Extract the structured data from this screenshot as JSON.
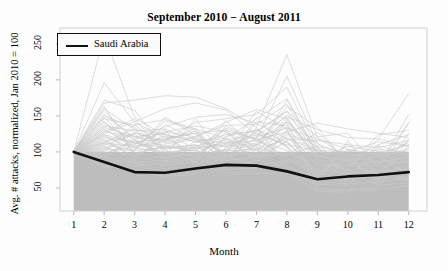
{
  "chart_data": {
    "type": "line",
    "title": "September 2010 − August 2011",
    "xlabel": "Month",
    "ylabel": "Avg. # attacks, normalized, Jan 2010 = 100",
    "xlim": [
      0.55,
      12.6
    ],
    "ylim": [
      18,
      272
    ],
    "xticks": [
      "1",
      "2",
      "3",
      "4",
      "5",
      "6",
      "7",
      "8",
      "9",
      "10",
      "11",
      "12"
    ],
    "yticks": [
      "50",
      "100",
      "150",
      "200",
      "250"
    ],
    "grid": false,
    "legend": {
      "position": "top-left",
      "entries": [
        {
          "label": "Saudi Arabia",
          "color": "#111111",
          "style": "solid-thick"
        }
      ]
    },
    "shaded_band": {
      "label": "reference band below index 100",
      "y_from": 18,
      "y_to": 100,
      "x_from": 1,
      "x_to": 12,
      "color": "#bdbdbd"
    },
    "categories": [
      1,
      2,
      3,
      4,
      5,
      6,
      7,
      8,
      9,
      10,
      11,
      12
    ],
    "series": [
      {
        "name": "Saudi Arabia",
        "highlight": true,
        "color": "#111111",
        "values": [
          100,
          86,
          72,
          71,
          77,
          82,
          81,
          73,
          62,
          66,
          68,
          72
        ]
      },
      {
        "name": "country-01",
        "color": "#c9c9c9",
        "values": [
          100,
          262,
          148,
          122,
          118,
          112,
          121,
          133,
          118,
          104,
          96,
          101
        ]
      },
      {
        "name": "country-02",
        "color": "#c9c9c9",
        "values": [
          100,
          196,
          141,
          119,
          126,
          130,
          118,
          205,
          111,
          95,
          98,
          110
        ]
      },
      {
        "name": "country-03",
        "color": "#c9c9c9",
        "values": [
          100,
          168,
          172,
          178,
          176,
          160,
          134,
          235,
          120,
          92,
          99,
          96
        ]
      },
      {
        "name": "country-04",
        "color": "#c9c9c9",
        "values": [
          100,
          152,
          120,
          116,
          141,
          146,
          152,
          190,
          104,
          90,
          93,
          113
        ]
      },
      {
        "name": "country-05",
        "color": "#c9c9c9",
        "values": [
          100,
          146,
          137,
          145,
          132,
          119,
          146,
          174,
          99,
          88,
          110,
          124
        ]
      },
      {
        "name": "country-06",
        "color": "#c9c9c9",
        "values": [
          100,
          141,
          112,
          106,
          122,
          137,
          138,
          166,
          96,
          86,
          104,
          98
        ]
      },
      {
        "name": "country-07",
        "color": "#c9c9c9",
        "values": [
          100,
          136,
          129,
          132,
          113,
          124,
          129,
          157,
          94,
          102,
          95,
          92
        ]
      },
      {
        "name": "country-08",
        "color": "#c9c9c9",
        "values": [
          100,
          132,
          106,
          98,
          108,
          117,
          123,
          149,
          131,
          120,
          118,
          181
        ]
      },
      {
        "name": "country-09",
        "color": "#c9c9c9",
        "values": [
          100,
          128,
          121,
          126,
          104,
          110,
          115,
          142,
          89,
          84,
          86,
          92
        ]
      },
      {
        "name": "country-10",
        "color": "#c9c9c9",
        "values": [
          100,
          124,
          99,
          91,
          97,
          103,
          109,
          135,
          86,
          80,
          82,
          140
        ]
      },
      {
        "name": "country-11",
        "color": "#c9c9c9",
        "values": [
          100,
          120,
          114,
          118,
          126,
          96,
          103,
          128,
          140,
          132,
          126,
          120
        ]
      },
      {
        "name": "country-12",
        "color": "#c9c9c9",
        "values": [
          100,
          116,
          93,
          86,
          90,
          94,
          98,
          121,
          78,
          74,
          118,
          108
        ]
      },
      {
        "name": "country-13",
        "color": "#c9c9c9",
        "values": [
          100,
          112,
          108,
          111,
          117,
          88,
          92,
          114,
          74,
          70,
          72,
          79
        ]
      },
      {
        "name": "country-14",
        "color": "#c9c9c9",
        "values": [
          100,
          108,
          88,
          81,
          85,
          122,
          130,
          107,
          70,
          67,
          69,
          141
        ]
      },
      {
        "name": "country-15",
        "color": "#c9c9c9",
        "values": [
          100,
          104,
          102,
          105,
          110,
          83,
          87,
          100,
          66,
          63,
          65,
          71
        ]
      },
      {
        "name": "country-16",
        "color": "#c9c9c9",
        "values": [
          100,
          100,
          84,
          77,
          80,
          112,
          116,
          94,
          62,
          60,
          108,
          66
        ]
      },
      {
        "name": "country-17",
        "color": "#c9c9c9",
        "values": [
          100,
          97,
          96,
          99,
          103,
          79,
          82,
          88,
          100,
          96,
          61,
          118
        ]
      },
      {
        "name": "country-18",
        "color": "#c9c9c9",
        "values": [
          100,
          94,
          80,
          73,
          76,
          106,
          110,
          140,
          58,
          56,
          58,
          63
        ]
      },
      {
        "name": "country-19",
        "color": "#c9c9c9",
        "values": [
          100,
          91,
          90,
          93,
          97,
          75,
          78,
          83,
          55,
          53,
          100,
          60
        ]
      },
      {
        "name": "country-20",
        "color": "#c9c9c9",
        "values": [
          100,
          88,
          76,
          70,
          72,
          101,
          104,
          78,
          52,
          92,
          54,
          57
        ]
      },
      {
        "name": "country-21",
        "color": "#c9c9c9",
        "values": [
          100,
          85,
          85,
          88,
          92,
          71,
          74,
          132,
          49,
          48,
          51,
          100
        ]
      },
      {
        "name": "country-22",
        "color": "#c9c9c9",
        "values": [
          100,
          82,
          72,
          66,
          69,
          96,
          99,
          74,
          47,
          46,
          48,
          53
        ]
      },
      {
        "name": "country-23",
        "color": "#c9c9c9",
        "values": [
          100,
          79,
          81,
          84,
          87,
          68,
          70,
          71,
          45,
          44,
          88,
          51
        ]
      },
      {
        "name": "country-24",
        "color": "#c9c9c9",
        "values": [
          100,
          160,
          131,
          124,
          114,
          108,
          112,
          152,
          108,
          98,
          92,
          104
        ]
      },
      {
        "name": "country-25",
        "color": "#c9c9c9",
        "values": [
          100,
          138,
          117,
          135,
          148,
          152,
          140,
          118,
          116,
          110,
          106,
          116
        ]
      },
      {
        "name": "country-26",
        "color": "#c9c9c9",
        "values": [
          100,
          126,
          142,
          160,
          168,
          158,
          124,
          110,
          102,
          100,
          114,
          108
        ]
      },
      {
        "name": "country-27",
        "color": "#c9c9c9",
        "values": [
          100,
          113,
          126,
          113,
          120,
          141,
          159,
          146,
          92,
          108,
          101,
          94
        ]
      },
      {
        "name": "country-28",
        "color": "#c9c9c9",
        "values": [
          100,
          106,
          111,
          128,
          136,
          128,
          107,
          163,
          134,
          82,
          87,
          86
        ]
      },
      {
        "name": "country-29",
        "color": "#c9c9c9",
        "values": [
          100,
          150,
          134,
          101,
          94,
          102,
          128,
          156,
          121,
          126,
          79,
          88
        ]
      },
      {
        "name": "country-30",
        "color": "#c9c9c9",
        "values": [
          100,
          122,
          104,
          143,
          130,
          90,
          95,
          126,
          82,
          76,
          124,
          130
        ]
      },
      {
        "name": "country-31",
        "color": "#c9c9c9",
        "values": [
          100,
          95,
          118,
          96,
          106,
          133,
          116,
          102,
          76,
          71,
          74,
          98
        ]
      },
      {
        "name": "country-32",
        "color": "#c9c9c9",
        "values": [
          100,
          143,
          98,
          108,
          101,
          86,
          142,
          136,
          106,
          64,
          68,
          82
        ]
      },
      {
        "name": "country-33",
        "color": "#c9c9c9",
        "values": [
          100,
          109,
          125,
          88,
          115,
          119,
          88,
          116,
          68,
          112,
          62,
          75
        ]
      },
      {
        "name": "country-34",
        "color": "#c9c9c9",
        "values": [
          100,
          131,
          110,
          131,
          82,
          98,
          106,
          94,
          128,
          86,
          93,
          69
        ]
      },
      {
        "name": "country-35",
        "color": "#c9c9c9",
        "values": [
          100,
          118,
          92,
          119,
          93,
          127,
          98,
          148,
          90,
          74,
          83,
          116
        ]
      },
      {
        "name": "country-36",
        "color": "#c9c9c9",
        "values": [
          100,
          102,
          138,
          104,
          110,
          78,
          134,
          80,
          64,
          104,
          71,
          64
        ]
      },
      {
        "name": "country-37",
        "color": "#c9c9c9",
        "values": [
          100,
          157,
          115,
          92,
          99,
          115,
          91,
          124,
          113,
          68,
          97,
          87
        ]
      },
      {
        "name": "country-38",
        "color": "#c9c9c9",
        "values": [
          100,
          111,
          101,
          148,
          124,
          93,
          120,
          88,
          72,
          94,
          57,
          79
        ]
      },
      {
        "name": "country-39",
        "color": "#c9c9c9",
        "values": [
          100,
          128,
          146,
          97,
          88,
          144,
          101,
          172,
          98,
          58,
          80,
          152
        ]
      },
      {
        "name": "country-40",
        "color": "#c9c9c9",
        "values": [
          100,
          99,
          108,
          114,
          133,
          84,
          148,
          106,
          57,
          116,
          66,
          61
        ]
      },
      {
        "name": "country-41",
        "color": "#c9c9c9",
        "values": [
          100,
          172,
          158,
          102,
          91,
          104,
          94,
          98,
          84,
          78,
          109,
          96
        ]
      },
      {
        "name": "country-42",
        "color": "#c9c9c9",
        "values": [
          100,
          105,
          94,
          138,
          117,
          99,
          156,
          132,
          61,
          62,
          76,
          70
        ]
      },
      {
        "name": "country-43",
        "color": "#c9c9c9",
        "values": [
          100,
          134,
          122,
          107,
          102,
          131,
          86,
          144,
          94,
          88,
          64,
          126
        ]
      },
      {
        "name": "country-44",
        "color": "#c9c9c9",
        "values": [
          100,
          92,
          116,
          94,
          146,
          89,
          111,
          91,
          76,
          54,
          90,
          84
        ]
      },
      {
        "name": "country-45",
        "color": "#c9c9c9",
        "values": [
          100,
          148,
          104,
          122,
          96,
          118,
          103,
          118,
          103,
          72,
          54,
          92
        ]
      },
      {
        "name": "country-46",
        "color": "#c9c9c9",
        "values": [
          100,
          114,
          132,
          86,
          108,
          107,
          126,
          109,
          66,
          98,
          86,
          58
        ]
      },
      {
        "name": "country-47",
        "color": "#c9c9c9",
        "values": [
          100,
          86,
          89,
          128,
          121,
          95,
          82,
          86,
          88,
          66,
          102,
          74
        ]
      },
      {
        "name": "country-48",
        "color": "#c9c9c9",
        "values": [
          100,
          124,
          113,
          99,
          86,
          136,
          117,
          128,
          80,
          82,
          70,
          106
        ]
      },
      {
        "name": "country-49",
        "color": "#c9c9c9",
        "values": [
          100,
          101,
          127,
          116,
          129,
          81,
          96,
          96,
          108,
          60,
          95,
          68
        ]
      },
      {
        "name": "country-50",
        "color": "#c9c9c9",
        "values": [
          100,
          163,
          96,
          109,
          105,
          112,
          131,
          113,
          71,
          90,
          59,
          111
        ]
      }
    ]
  }
}
